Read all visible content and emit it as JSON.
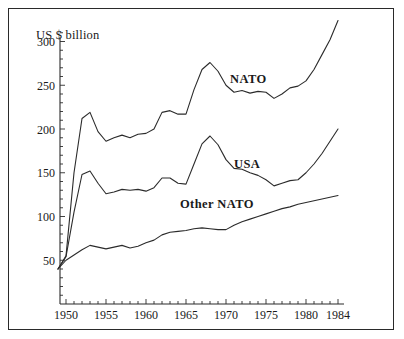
{
  "chart_data": {
    "type": "line",
    "title": "",
    "subtitle": "",
    "xlabel": "",
    "ylabel": "US $ billion",
    "xlim": [
      1949,
      1985
    ],
    "ylim": [
      0,
      320
    ],
    "grid": false,
    "legend_position": "inline-labels",
    "y_ticks": [
      50,
      100,
      150,
      200,
      250,
      300
    ],
    "y_minor_tick_step": 10,
    "x_ticks": [
      1950,
      1955,
      1960,
      1965,
      1970,
      1975,
      1980,
      1984
    ],
    "x_minor_tick_step": 1,
    "x": [
      1949,
      1950,
      1951,
      1952,
      1953,
      1954,
      1955,
      1956,
      1957,
      1958,
      1959,
      1960,
      1961,
      1962,
      1963,
      1964,
      1965,
      1966,
      1967,
      1968,
      1969,
      1970,
      1971,
      1972,
      1973,
      1974,
      1975,
      1976,
      1977,
      1978,
      1979,
      1980,
      1981,
      1982,
      1983,
      1984
    ],
    "series": [
      {
        "name": "NATO",
        "label": "NATO",
        "values": [
          40,
          55,
          150,
          212,
          219,
          197,
          186,
          190,
          193,
          190,
          194,
          195,
          200,
          219,
          221,
          217,
          217,
          245,
          268,
          276,
          266,
          250,
          242,
          244,
          241,
          243,
          242,
          235,
          240,
          247,
          249,
          255,
          268,
          285,
          302,
          324
        ]
      },
      {
        "name": "USA",
        "label": "USA",
        "values": [
          40,
          54,
          105,
          148,
          152,
          138,
          126,
          128,
          131,
          130,
          131,
          129,
          133,
          144,
          144,
          138,
          137,
          160,
          183,
          192,
          182,
          165,
          155,
          154,
          150,
          147,
          142,
          135,
          138,
          141,
          142,
          150,
          160,
          172,
          186,
          200
        ]
      },
      {
        "name": "Other NATO",
        "label": "Other NATO",
        "values": [
          40,
          50,
          56,
          62,
          67,
          65,
          63,
          65,
          67,
          64,
          66,
          70,
          73,
          79,
          82,
          83,
          84,
          86,
          87,
          86,
          85,
          85,
          90,
          94,
          97,
          100,
          103,
          106,
          109,
          111,
          114,
          116,
          118,
          120,
          122,
          124
        ]
      }
    ]
  },
  "axis": {
    "y_title": "US $ billion"
  }
}
